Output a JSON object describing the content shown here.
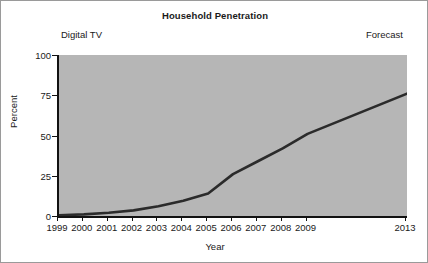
{
  "chart_data": {
    "type": "line",
    "title": "Household Penetration",
    "xlabel": "Year",
    "ylabel": "Percent",
    "grid": false,
    "legend": null,
    "plot_background": "#b6b6b6",
    "line_color": "#2b2b2b",
    "xlim": [
      0,
      14
    ],
    "ylim": [
      0,
      100
    ],
    "yticks": [
      0,
      25,
      50,
      75,
      100
    ],
    "ytick_labels": [
      "0",
      "25",
      "50",
      "75",
      "100"
    ],
    "categories": [
      "1999",
      "2000",
      "2001",
      "2002",
      "2003",
      "2004",
      "2005",
      "2006",
      "2007",
      "2008",
      "2009",
      "2013"
    ],
    "xtick_labels": [
      "1999",
      "2000",
      "2001",
      "2002",
      "2003",
      "2004",
      "2005",
      "2006",
      "2007",
      "2008",
      "2009",
      "2013"
    ],
    "xtick_positions": [
      0,
      1,
      2,
      3,
      4,
      5,
      6,
      7,
      8,
      9,
      10,
      14
    ],
    "axis_break_note": "axis compressed between 2009 and 2013",
    "series": [
      {
        "name": "Digital TV household penetration",
        "x": [
          0,
          1,
          2,
          3,
          4,
          5,
          6,
          7,
          8,
          9,
          10,
          14
        ],
        "values": [
          0.5,
          1,
          2,
          3.5,
          6,
          9.5,
          14,
          26,
          34,
          42,
          51,
          76
        ]
      }
    ],
    "annotations": [
      {
        "text": "Digital TV",
        "position": "top-left"
      },
      {
        "text": "Forecast",
        "position": "top-right"
      }
    ]
  }
}
